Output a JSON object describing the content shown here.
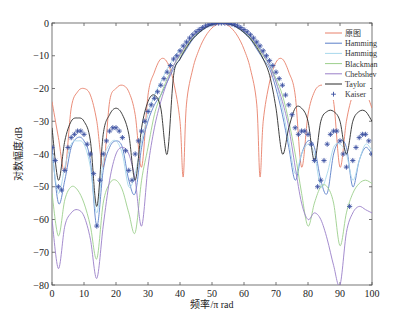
{
  "chart_data": {
    "type": "line",
    "title": "",
    "xlabel": "频率/π rad",
    "ylabel": "对数幅度/dB",
    "xlim": [
      0,
      100
    ],
    "ylim": [
      -80,
      0
    ],
    "xticks": [
      0,
      10,
      20,
      30,
      40,
      50,
      60,
      70,
      80,
      90,
      100
    ],
    "yticks": [
      0,
      -10,
      -20,
      -30,
      -40,
      -50,
      -60,
      -70,
      -80
    ],
    "grid": false,
    "legend_position": "upper-right",
    "series": [
      {
        "name": "原图",
        "color": "#e8806a",
        "style": "line",
        "x": [
          0,
          2,
          4,
          6,
          8,
          10,
          12,
          14,
          16,
          18,
          20,
          22,
          24,
          26,
          28,
          30,
          32,
          34,
          36,
          38,
          40,
          41,
          42,
          44,
          46,
          48,
          50,
          52,
          53,
          54,
          56,
          58,
          60,
          62,
          64,
          65,
          66,
          68,
          70,
          72,
          74,
          76,
          78,
          80,
          82,
          84,
          86,
          88,
          90,
          92,
          94,
          96,
          98,
          100
        ],
        "y": [
          -24,
          -35,
          -45,
          -26,
          -21,
          -20,
          -22,
          -30,
          -44,
          -24,
          -20,
          -19,
          -21,
          -28,
          -44,
          -22,
          -15,
          -11,
          -12,
          -18,
          -30,
          -47,
          -25,
          -14,
          -8,
          -4,
          -1.5,
          -0.2,
          0,
          -0.2,
          -1.5,
          -4,
          -8,
          -14,
          -25,
          -47,
          -30,
          -18,
          -12,
          -11,
          -15,
          -22,
          -44,
          -28,
          -21,
          -19,
          -20,
          -24,
          -44,
          -30,
          -22,
          -20,
          -21,
          -26
        ]
      },
      {
        "name": "Hamming",
        "color": "#5a7fc8",
        "style": "line",
        "x": [
          0,
          2,
          4,
          6,
          8,
          10,
          12,
          14,
          16,
          18,
          20,
          22,
          24,
          26,
          28,
          30,
          32,
          34,
          36,
          38,
          40,
          42,
          44,
          46,
          48,
          50,
          52,
          53,
          54,
          56,
          58,
          60,
          62,
          64,
          66,
          68,
          70,
          72,
          74,
          76,
          78,
          80,
          82,
          84,
          86,
          88,
          90,
          92,
          94,
          96,
          98,
          100
        ],
        "y": [
          -38,
          -55,
          -48,
          -38,
          -35,
          -36,
          -42,
          -62,
          -45,
          -38,
          -36,
          -38,
          -48,
          -52,
          -38,
          -30,
          -25,
          -22,
          -18,
          -14,
          -11,
          -8,
          -5,
          -3,
          -1.5,
          -0.5,
          -0.1,
          0,
          -0.1,
          -0.5,
          -1.5,
          -3,
          -5,
          -8,
          -11,
          -14,
          -20,
          -28,
          -38,
          -48,
          -40,
          -36,
          -38,
          -48,
          -52,
          -40,
          -36,
          -38,
          -50,
          -42,
          -38,
          -40
        ]
      },
      {
        "name": "Hamming",
        "color": "#a8d8ec",
        "style": "line",
        "x": [
          0,
          2,
          4,
          6,
          8,
          10,
          12,
          14,
          16,
          18,
          20,
          22,
          24,
          26,
          28,
          30,
          32,
          34,
          36,
          38,
          40,
          42,
          44,
          46,
          48,
          50,
          52,
          53,
          54,
          56,
          58,
          60,
          62,
          64,
          66,
          68,
          70,
          72,
          74,
          76,
          78,
          80,
          82,
          84,
          86,
          88,
          90,
          92,
          94,
          96,
          98,
          100
        ],
        "y": [
          -40,
          -52,
          -44,
          -37,
          -36,
          -37,
          -44,
          -58,
          -42,
          -37,
          -36,
          -40,
          -50,
          -46,
          -36,
          -28,
          -22,
          -18,
          -14,
          -11,
          -8,
          -6,
          -4,
          -2.5,
          -1.2,
          -0.4,
          -0.1,
          0,
          -0.1,
          -0.4,
          -1.2,
          -2.5,
          -4,
          -6,
          -9,
          -12,
          -18,
          -26,
          -36,
          -46,
          -40,
          -37,
          -40,
          -50,
          -46,
          -38,
          -37,
          -40,
          -48,
          -42,
          -37,
          -39
        ]
      },
      {
        "name": "Blackman",
        "color": "#9ccf8c",
        "style": "line",
        "x": [
          0,
          2,
          4,
          6,
          8,
          10,
          12,
          14,
          16,
          18,
          20,
          22,
          24,
          26,
          28,
          30,
          32,
          34,
          36,
          38,
          40,
          42,
          44,
          46,
          48,
          50,
          52,
          53,
          54,
          56,
          58,
          60,
          62,
          64,
          66,
          68,
          70,
          72,
          74,
          76,
          78,
          80,
          82,
          84,
          86,
          88,
          90,
          92,
          94,
          96,
          98,
          100
        ],
        "y": [
          -52,
          -65,
          -54,
          -50,
          -51,
          -55,
          -62,
          -72,
          -55,
          -49,
          -48,
          -51,
          -58,
          -64,
          -48,
          -38,
          -28,
          -22,
          -17,
          -13,
          -10,
          -7,
          -4.5,
          -2.8,
          -1.4,
          -0.5,
          -0.1,
          0,
          -0.1,
          -0.5,
          -1.4,
          -2.8,
          -4.5,
          -7,
          -10,
          -13,
          -17,
          -22,
          -30,
          -40,
          -52,
          -62,
          -55,
          -50,
          -50,
          -55,
          -68,
          -58,
          -52,
          -49,
          -48,
          -49
        ]
      },
      {
        "name": "Chebyshev",
        "color": "#9a7fc8",
        "style": "line",
        "x": [
          0,
          2,
          4,
          6,
          8,
          10,
          12,
          14,
          16,
          18,
          20,
          22,
          24,
          26,
          28,
          30,
          32,
          34,
          36,
          38,
          40,
          42,
          44,
          46,
          48,
          50,
          52,
          53,
          54,
          56,
          58,
          60,
          62,
          64,
          66,
          68,
          70,
          72,
          74,
          76,
          78,
          80,
          82,
          84,
          86,
          88,
          90,
          92,
          94,
          96,
          98,
          100
        ],
        "y": [
          -60,
          -75,
          -62,
          -58,
          -57,
          -59,
          -66,
          -78,
          -62,
          -48,
          -40,
          -38,
          -40,
          -48,
          -62,
          -44,
          -32,
          -24,
          -18,
          -13,
          -9.5,
          -6.5,
          -4,
          -2.4,
          -1.2,
          -0.4,
          -0.1,
          0,
          -0.1,
          -0.4,
          -1.2,
          -2.4,
          -4,
          -6.5,
          -9.5,
          -13,
          -18,
          -24,
          -32,
          -44,
          -55,
          -60,
          -58,
          -60,
          -66,
          -74,
          -80,
          -64,
          -58,
          -56,
          -57,
          -58
        ]
      },
      {
        "name": "Taylor",
        "color": "#2a2a2a",
        "style": "line",
        "x": [
          0,
          2,
          4,
          6,
          8,
          10,
          12,
          14,
          16,
          18,
          20,
          22,
          24,
          26,
          28,
          30,
          32,
          34,
          36,
          38,
          40,
          42,
          44,
          46,
          48,
          50,
          52,
          53,
          54,
          56,
          58,
          60,
          62,
          64,
          66,
          68,
          70,
          72,
          74,
          76,
          78,
          80,
          82,
          84,
          86,
          88,
          90,
          92,
          94,
          96,
          98,
          100
        ],
        "y": [
          -32,
          -48,
          -36,
          -30,
          -29,
          -30,
          -36,
          -56,
          -34,
          -28,
          -26,
          -28,
          -34,
          -48,
          -32,
          -24,
          -22,
          -26,
          -40,
          -16,
          -11,
          -7.5,
          -4.8,
          -2.9,
          -1.4,
          -0.5,
          -0.1,
          0,
          -0.1,
          -0.5,
          -1.4,
          -2.9,
          -4.8,
          -7.5,
          -11,
          -16,
          -26,
          -40,
          -32,
          -26,
          -26,
          -30,
          -42,
          -30,
          -27,
          -27,
          -30,
          -40,
          -30,
          -27,
          -27,
          -30
        ]
      },
      {
        "name": "Kaiser",
        "color": "#3a4fa0",
        "style": "marker",
        "x": [
          0,
          1,
          2,
          3,
          4,
          5,
          6,
          7,
          8,
          9,
          10,
          11,
          12,
          13,
          14,
          15,
          16,
          17,
          18,
          19,
          20,
          21,
          22,
          23,
          24,
          25,
          26,
          27,
          28,
          29,
          30,
          31,
          32,
          33,
          34,
          35,
          36,
          37,
          38,
          39,
          40,
          41,
          42,
          43,
          44,
          45,
          46,
          47,
          48,
          49,
          50,
          51,
          52,
          53,
          54,
          55,
          56,
          57,
          58,
          59,
          60,
          61,
          62,
          63,
          64,
          65,
          66,
          67,
          68,
          69,
          70,
          71,
          72,
          73,
          74,
          75,
          76,
          77,
          78,
          79,
          80,
          81,
          82,
          83,
          84,
          85,
          86,
          87,
          88,
          89,
          90,
          91,
          92,
          93,
          94,
          95,
          96,
          97,
          98,
          99,
          100
        ],
        "y": [
          -38,
          -42,
          -50,
          -51,
          -45,
          -38,
          -35,
          -34,
          -33,
          -33,
          -34,
          -37,
          -40,
          -46,
          -62,
          -48,
          -40,
          -36,
          -33,
          -32,
          -32,
          -33,
          -35,
          -39,
          -45,
          -48,
          -40,
          -36,
          -33,
          -30,
          -27,
          -25,
          -23,
          -21,
          -19,
          -17,
          -15,
          -13,
          -11,
          -10,
          -8.5,
          -7,
          -5.8,
          -4.6,
          -3.6,
          -2.7,
          -2,
          -1.4,
          -0.9,
          -0.5,
          -0.25,
          -0.1,
          -0.02,
          0,
          -0.02,
          -0.1,
          -0.25,
          -0.5,
          -0.9,
          -1.4,
          -2,
          -2.7,
          -3.6,
          -4.6,
          -5.8,
          -7,
          -8.5,
          -10,
          -11.5,
          -13,
          -15,
          -17,
          -19,
          -22,
          -25,
          -28,
          -32,
          -34,
          -33,
          -33,
          -34,
          -37,
          -42,
          -50,
          -48,
          -42,
          -37,
          -34,
          -33,
          -33,
          -36,
          -40,
          -44,
          -56,
          -42,
          -38,
          -35,
          -34,
          -34,
          -36,
          -40
        ]
      }
    ]
  },
  "axes": {
    "xlabel": "频率/π rad",
    "ylabel": "对数幅度/dB",
    "xtick_labels": [
      "0",
      "10",
      "20",
      "30",
      "40",
      "50",
      "60",
      "70",
      "80",
      "90",
      "100"
    ],
    "ytick_labels": [
      "0",
      "−10",
      "−20",
      "−30",
      "−40",
      "−50",
      "−60",
      "−70",
      "−80"
    ]
  },
  "legend": {
    "entries": [
      "原图",
      "Hamming",
      "Hamming",
      "Blackman",
      "Chebshev",
      "Taylor",
      "Kaiser"
    ]
  }
}
